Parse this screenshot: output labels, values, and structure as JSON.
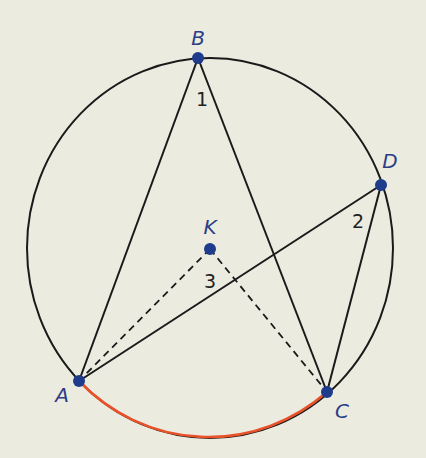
{
  "diagram": {
    "type": "inscribed-angles-circle",
    "circle": {
      "center": "K",
      "cx": 210,
      "cy": 248,
      "rx": 183,
      "ry": 190
    },
    "points": [
      {
        "id": "B",
        "label": "B",
        "x": 198,
        "y": 58,
        "label_x": 198,
        "label_y": 45
      },
      {
        "id": "D",
        "label": "D",
        "x": 381,
        "y": 185,
        "label_x": 390,
        "label_y": 168
      },
      {
        "id": "K",
        "label": "K",
        "x": 210,
        "y": 249,
        "label_x": 210,
        "label_y": 234
      },
      {
        "id": "A",
        "label": "A",
        "x": 79,
        "y": 381,
        "label_x": 62,
        "label_y": 402
      },
      {
        "id": "C",
        "label": "C",
        "x": 327,
        "y": 392,
        "label_x": 342,
        "label_y": 418
      }
    ],
    "angle_labels": [
      {
        "id": "angle-1",
        "label": "1",
        "vertex": "B",
        "x": 202,
        "y": 106
      },
      {
        "id": "angle-2",
        "label": "2",
        "vertex": "D",
        "x": 358,
        "y": 228
      },
      {
        "id": "angle-3",
        "label": "3",
        "vertex": "K",
        "x": 210,
        "y": 288
      }
    ],
    "segments": [
      {
        "from": "B",
        "to": "A",
        "style": "solid"
      },
      {
        "from": "B",
        "to": "C",
        "style": "solid"
      },
      {
        "from": "D",
        "to": "A",
        "style": "solid"
      },
      {
        "from": "D",
        "to": "C",
        "style": "solid"
      },
      {
        "from": "K",
        "to": "A",
        "style": "dashed"
      },
      {
        "from": "K",
        "to": "C",
        "style": "dashed"
      }
    ],
    "highlighted_arc": {
      "from": "A",
      "to": "C",
      "color": "#e8522a"
    },
    "colors": {
      "background": "#ecebe0",
      "circle": "#1a1a1a",
      "segments": "#1a1a1a",
      "points": "#1f3c8c",
      "point_labels": "#2c3d86",
      "arc_highlight": "#e8522a"
    }
  }
}
